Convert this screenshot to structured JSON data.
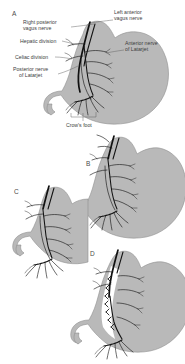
{
  "figure": {
    "background_color": "#ffffff",
    "stomach_fill": "#b9b9b9",
    "stomach_stroke": "#8e8e8e",
    "nerve_color": "#111111",
    "leader_color": "#5a5a5a",
    "label_color": "#3d3d3d"
  },
  "panels": [
    {
      "letter": "A",
      "name": "truncal-anatomy",
      "caption": "Normal vagal anatomy of the stomach"
    },
    {
      "letter": "B",
      "name": "truncal-vagotomy",
      "caption": "Truncal vagotomy"
    },
    {
      "letter": "C",
      "name": "selective-vagotomy",
      "caption": "Selective vagotomy"
    },
    {
      "letter": "D",
      "name": "highly-selective-vagotomy",
      "caption": "Highly selective vagotomy"
    }
  ],
  "labels": [
    {
      "id": "right-posterior-vagus-nerve",
      "line1": "Right posterior",
      "line2": "vagus nerve"
    },
    {
      "id": "left-anterior-vagus-nerve",
      "line1": "Left anterior",
      "line2": "vagus nerve"
    },
    {
      "id": "hepatic-division",
      "line1": "Hepatic division",
      "line2": ""
    },
    {
      "id": "anterior-nerve-of-latarjet",
      "line1": "Anterior nerve",
      "line2": "of Latarjet"
    },
    {
      "id": "celiac-division",
      "line1": "Celiac division",
      "line2": ""
    },
    {
      "id": "posterior-nerve-of-latarjet",
      "line1": "Posterior nerve",
      "line2": "of Latarjet"
    },
    {
      "id": "crows-foot",
      "line1": "Crow's foot",
      "line2": ""
    }
  ]
}
